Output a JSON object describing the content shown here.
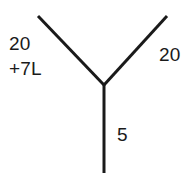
{
  "figure": {
    "type": "y-junction-diagram",
    "background_color": "#ffffff",
    "stroke_color": "#1a1a1a",
    "stroke_width": 3
  },
  "labels": {
    "left_primary": "20",
    "left_secondary": "+7L",
    "right": "20",
    "bottom": "5"
  },
  "branches": [
    {
      "name": "upper-left-branch",
      "label": "20",
      "sublabel": "+7L",
      "start": [
        38,
        16
      ],
      "end": [
        104,
        85
      ]
    },
    {
      "name": "upper-right-branch",
      "label": "20",
      "start": [
        167,
        16
      ],
      "end": [
        104,
        85
      ]
    },
    {
      "name": "lower-stem-branch",
      "label": "5",
      "start": [
        104,
        85
      ],
      "end": [
        104,
        173
      ]
    }
  ],
  "vertex": [
    104,
    85
  ]
}
